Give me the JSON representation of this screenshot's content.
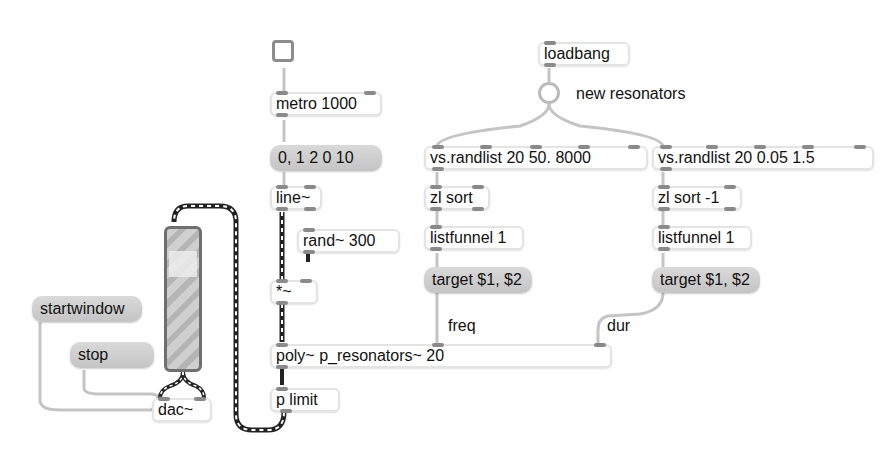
{
  "patcher": {
    "toggle": {
      "label": ""
    },
    "loadbang": {
      "label": "loadbang"
    },
    "bang_comment": "new resonators",
    "metro": {
      "label": "metro 1000"
    },
    "line_msg": {
      "label": "0, 1 2 0 10"
    },
    "line": {
      "label": "line~"
    },
    "rand": {
      "label": "rand~ 300"
    },
    "mult": {
      "label": "*~"
    },
    "randlist_freq": {
      "label": "vs.randlist 20 50. 8000"
    },
    "randlist_dur": {
      "label": "vs.randlist 20 0.05 1.5"
    },
    "zl_sort_freq": {
      "label": "zl sort"
    },
    "zl_sort_dur": {
      "label": "zl sort -1"
    },
    "listfunnel_freq": {
      "label": "listfunnel 1"
    },
    "listfunnel_dur": {
      "label": "listfunnel 1"
    },
    "target_freq": {
      "label": "target $1, $2"
    },
    "target_dur": {
      "label": "target $1, $2"
    },
    "freq_comment": "freq",
    "dur_comment": "dur",
    "poly": {
      "label": "poly~ p_resonators~ 20"
    },
    "plimit": {
      "label": "p limit"
    },
    "startwindow": {
      "label": "startwindow"
    },
    "stop": {
      "label": "stop"
    },
    "dac": {
      "label": "dac~"
    }
  },
  "colors": {
    "background": "#ffffff",
    "message_box": "#cdcdcd",
    "object_border": "#e4e4e4",
    "port": "#8a8a8a",
    "control_cord": "#bdbdbd",
    "signal_cord": "#2a2a2a",
    "meter_border": "#6f6f6f"
  }
}
